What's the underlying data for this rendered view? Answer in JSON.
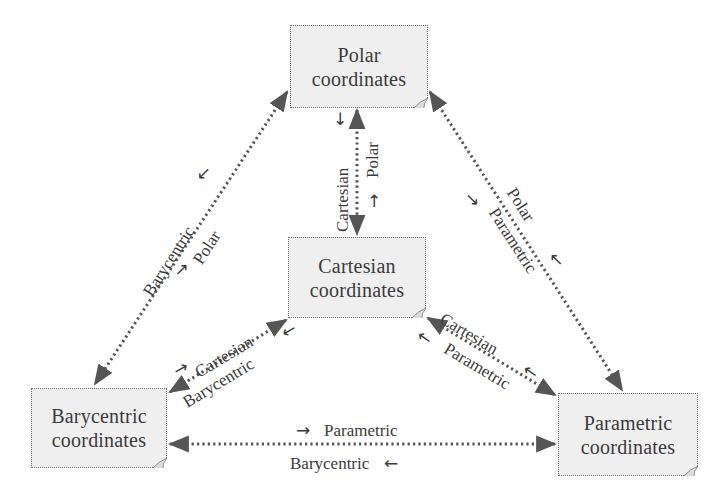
{
  "diagram": {
    "type": "coordinate-system conversion diagram",
    "nodes": {
      "polar": {
        "line1": "Polar",
        "line2": "coordinates"
      },
      "cartesian": {
        "line1": "Cartesian",
        "line2": "coordinates"
      },
      "barycentric": {
        "line1": "Barycentric",
        "line2": "coordinates"
      },
      "parametric": {
        "line1": "Parametric",
        "line2": "coordinates"
      }
    },
    "edges": {
      "polar_cartesian": {
        "to_cartesian": "Cartesian",
        "to_polar": "Polar"
      },
      "polar_barycentric": {
        "to_barycentric": "Barycentric",
        "to_polar": "Polar"
      },
      "polar_parametric": {
        "to_polar": "Polar",
        "to_parametric": "Parametric"
      },
      "cartesian_barycentric": {
        "to_cartesian": "Cartesian",
        "to_barycentric": "Barycentric"
      },
      "cartesian_parametric": {
        "to_cartesian": "Cartesian",
        "to_parametric": "Parametric"
      },
      "barycentric_parametric": {
        "to_parametric": "Parametric",
        "to_barycentric": "Barycentric"
      }
    },
    "icons": {
      "arrow_right": "→",
      "arrow_left": "←",
      "arrow_up": "↑",
      "arrow_down": "↓"
    },
    "colors": {
      "box_fill": "#efefef",
      "box_border": "#6a6a6a",
      "line": "#555555",
      "text": "#3b3b3b"
    }
  }
}
